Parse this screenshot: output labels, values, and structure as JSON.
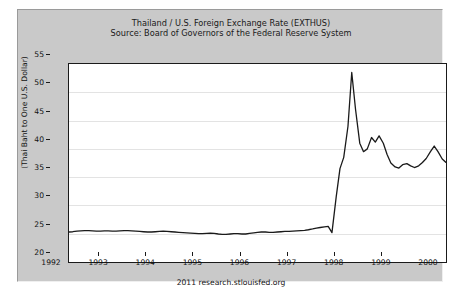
{
  "chart_data": {
    "type": "line",
    "title": "Thailand / U.S. Foreign Exchange Rate (EXTHUS)",
    "subtitle": "Source: Board of Governors of the Federal Reserve System",
    "xlabel": "",
    "ylabel": "(Thai Baht to One U.S. Dollar)",
    "footer": "2011 research.stlouisfed.org",
    "xlim": [
      1992,
      2000
    ],
    "ylim": [
      20,
      55
    ],
    "yticks": [
      20,
      25,
      30,
      35,
      40,
      45,
      50,
      55
    ],
    "xticks": [
      1992,
      1993,
      1994,
      1995,
      1996,
      1997,
      1998,
      1999,
      2000
    ],
    "xticklabels": [
      "1992",
      "1993",
      "1994",
      "1995",
      "1996",
      "1997",
      "1998",
      "1999",
      "2000"
    ],
    "yticklabels": [
      "20",
      "25",
      "30",
      "35",
      "40",
      "45",
      "50",
      "55"
    ],
    "grid": true,
    "legend": null,
    "line_color": "#1a1a1a",
    "series": [
      {
        "name": "EXTHUS",
        "x": [
          1992.0,
          1992.08,
          1992.17,
          1992.25,
          1992.33,
          1992.42,
          1992.5,
          1992.58,
          1992.67,
          1992.75,
          1992.83,
          1992.92,
          1993.0,
          1993.08,
          1993.17,
          1993.25,
          1993.33,
          1993.42,
          1993.5,
          1993.58,
          1993.67,
          1993.75,
          1993.83,
          1993.92,
          1994.0,
          1994.08,
          1994.17,
          1994.25,
          1994.33,
          1994.42,
          1994.5,
          1994.58,
          1994.67,
          1994.75,
          1994.83,
          1994.92,
          1995.0,
          1995.08,
          1995.17,
          1995.25,
          1995.33,
          1995.42,
          1995.5,
          1995.58,
          1995.67,
          1995.75,
          1995.83,
          1995.92,
          1996.0,
          1996.08,
          1996.17,
          1996.25,
          1996.33,
          1996.42,
          1996.5,
          1996.58,
          1996.67,
          1996.75,
          1996.83,
          1996.92,
          1997.0,
          1997.08,
          1997.17,
          1997.25,
          1997.33,
          1997.42,
          1997.5,
          1997.58,
          1997.67,
          1997.75,
          1997.83,
          1997.92,
          1998.0,
          1998.08,
          1998.17,
          1998.25,
          1998.33,
          1998.42,
          1998.5,
          1998.58,
          1998.67,
          1998.75,
          1998.83,
          1998.92,
          1999.0,
          1999.08,
          1999.17,
          1999.25,
          1999.33,
          1999.42,
          1999.5,
          1999.58,
          1999.67,
          1999.75,
          1999.83,
          1999.92,
          2000.0
        ],
        "y": [
          25.3,
          25.35,
          25.45,
          25.5,
          25.55,
          25.55,
          25.5,
          25.45,
          25.45,
          25.5,
          25.5,
          25.45,
          25.45,
          25.5,
          25.55,
          25.55,
          25.5,
          25.45,
          25.4,
          25.35,
          25.3,
          25.3,
          25.35,
          25.4,
          25.45,
          25.4,
          25.35,
          25.3,
          25.25,
          25.2,
          25.15,
          25.1,
          25.05,
          25.0,
          25.0,
          25.05,
          25.1,
          25.05,
          24.95,
          24.9,
          24.9,
          24.95,
          25.0,
          25.0,
          24.95,
          24.95,
          25.05,
          25.15,
          25.25,
          25.3,
          25.3,
          25.25,
          25.25,
          25.3,
          25.35,
          25.4,
          25.4,
          25.45,
          25.5,
          25.55,
          25.6,
          25.7,
          25.85,
          26.0,
          26.1,
          26.2,
          26.3,
          25.2,
          31.5,
          36.5,
          38.5,
          44.0,
          53.5,
          47.0,
          41.0,
          39.5,
          40.0,
          42.0,
          41.2,
          42.3,
          41.0,
          39.0,
          37.5,
          36.8,
          36.6,
          37.2,
          37.4,
          37.0,
          36.7,
          37.0,
          37.6,
          38.3,
          39.5,
          40.5,
          39.5,
          38.2,
          37.6
        ]
      }
    ]
  }
}
